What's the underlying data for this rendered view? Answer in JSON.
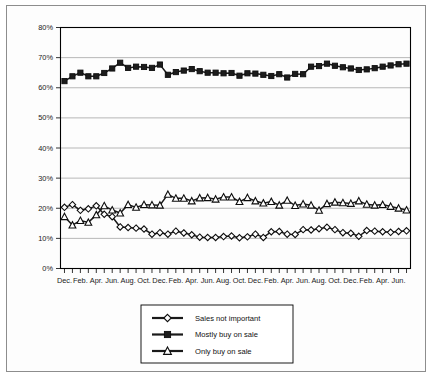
{
  "chart_data": {
    "type": "line",
    "title": "",
    "subtitle": "",
    "xlabel": "",
    "ylabel": "",
    "ylim": [
      0,
      80
    ],
    "ytick_labels": [
      "0%",
      "10%",
      "20%",
      "30%",
      "40%",
      "50%",
      "60%",
      "70%",
      "80%"
    ],
    "ytick_values": [
      0,
      10,
      20,
      30,
      40,
      50,
      60,
      70,
      80
    ],
    "grid": true,
    "legend_position": "bottom-center",
    "x_tick_count": 44,
    "xtick_labels": [
      "Dec.",
      "",
      "Feb.",
      "",
      "Apr.",
      "",
      "Jun.",
      "",
      "Aug.",
      "",
      "Oct.",
      "",
      "Dec.",
      "",
      "Feb.",
      "",
      "Apr.",
      "",
      "Jun.",
      "",
      "Aug.",
      "",
      "Oct.",
      "",
      "Dec.",
      "",
      "Feb.",
      "",
      "Apr.",
      "",
      "Jun.",
      "",
      "Aug.",
      "",
      "Oct.",
      "",
      "Dec.",
      "",
      "Feb.",
      "",
      "Apr.",
      "",
      "Jun.",
      ""
    ],
    "series": [
      {
        "name": "Sales not important",
        "marker": "diamond-open",
        "values": [
          20.3,
          21.2,
          19.3,
          19.8,
          20.8,
          18.0,
          17.2,
          13.8,
          13.6,
          13.4,
          13.1,
          11.4,
          11.9,
          11.4,
          12.4,
          11.8,
          11.2,
          10.4,
          10.3,
          10.3,
          10.6,
          10.8,
          10.2,
          10.5,
          11.4,
          10.3,
          12.2,
          12.3,
          11.4,
          11.3,
          12.9,
          12.8,
          13.2,
          13.7,
          12.9,
          11.9,
          11.7,
          10.7,
          12.6,
          12.4,
          12.2,
          12.0,
          12.3,
          12.5
        ]
      },
      {
        "name": "Mostly buy on sale",
        "marker": "square-filled",
        "values": [
          62.2,
          63.8,
          65.0,
          63.8,
          63.8,
          64.9,
          66.4,
          68.3,
          66.6,
          67.0,
          66.9,
          66.6,
          67.7,
          64.3,
          65.2,
          65.7,
          66.2,
          65.5,
          65.0,
          65.0,
          64.8,
          64.9,
          64.0,
          64.8,
          64.7,
          64.3,
          63.9,
          64.5,
          63.4,
          64.6,
          64.5,
          67.0,
          67.2,
          68.0,
          67.3,
          66.8,
          66.4,
          65.9,
          66.1,
          66.5,
          67.0,
          67.4,
          67.8,
          68.0
        ]
      },
      {
        "name": "Only buy on sale",
        "marker": "triangle-open",
        "values": [
          17.2,
          14.4,
          15.9,
          15.3,
          17.8,
          20.8,
          19.4,
          18.4,
          21.2,
          20.3,
          21.2,
          21.1,
          21.0,
          24.6,
          23.3,
          23.3,
          22.4,
          23.4,
          23.5,
          23.0,
          23.7,
          23.7,
          22.2,
          23.5,
          22.4,
          21.7,
          22.2,
          21.0,
          22.6,
          20.9,
          21.4,
          21.0,
          19.3,
          21.5,
          22.0,
          21.8,
          21.6,
          22.4,
          21.3,
          21.0,
          21.2,
          20.6,
          20.0,
          19.4
        ]
      }
    ]
  },
  "legend": {
    "items": [
      {
        "label": "Sales not important",
        "marker": "diamond-open"
      },
      {
        "label": "Mostly buy on sale",
        "marker": "square-filled"
      },
      {
        "label": "Only buy on sale",
        "marker": "triangle-open"
      }
    ]
  },
  "colors": {
    "line": "#1a1a1a",
    "grid": "#9a9a9a",
    "axis": "#000000",
    "marker_fill_open": "#ffffff",
    "marker_fill_solid": "#1c1c1c",
    "background": "#ffffff",
    "frame": "#8d8d8d"
  }
}
